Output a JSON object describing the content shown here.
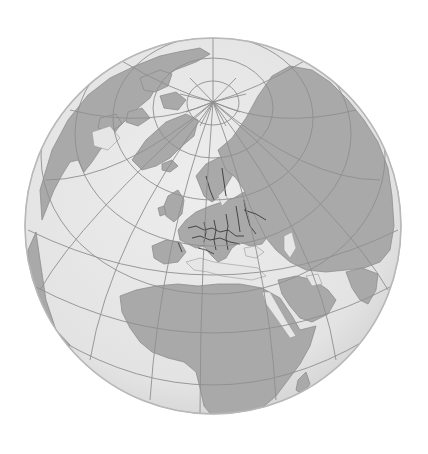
{
  "map": {
    "projection": "orthographic",
    "center_view": "Europe / North Atlantic, north pole near top",
    "globe": {
      "cx": 213,
      "cy": 226,
      "r": 188
    },
    "north_pole": {
      "x": 213,
      "y": 102
    },
    "colors": {
      "background": "#ffffff",
      "ocean": "#e6e6e6",
      "ocean_edge": "#bdbdbd",
      "land": "#a9a9a9",
      "land_stroke": "#8e8e8e",
      "graticule": "#8f8f8f",
      "borders": "#3a3a3a"
    },
    "regions_visible": [
      "North America (Canada, Arctic archipelago)",
      "Greenland",
      "Iceland",
      "British Isles",
      "Europe (with national borders)",
      "Scandinavia",
      "Russia / Siberia",
      "Middle East / Arabian Peninsula",
      "Africa",
      "India (edge)"
    ]
  }
}
